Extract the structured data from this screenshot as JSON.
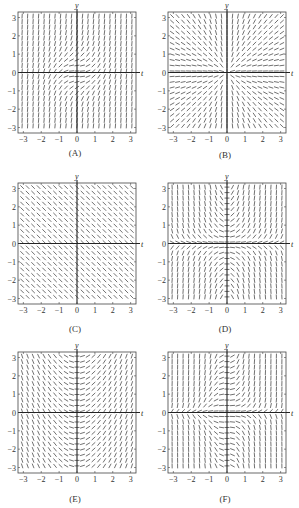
{
  "chart_data": [
    {
      "type": "slope-field",
      "label": "(A)",
      "formula_estimate": "dy/dt = t^2 + y^2",
      "xlabel": "t",
      "ylabel": "y",
      "xlim": [
        -3.3,
        3.3
      ],
      "ylim": [
        -3.3,
        3.3
      ],
      "xticks": [
        "-3",
        "-2",
        "-1",
        "0",
        "1",
        "2",
        "3"
      ],
      "yticks": [
        "-3",
        "-2",
        "-1",
        "0",
        "1",
        "2",
        "3"
      ],
      "grid_n": 21,
      "fn": "a"
    },
    {
      "type": "slope-field",
      "label": "(B)",
      "formula_estimate": "dy/dt = y/t",
      "xlabel": "t",
      "ylabel": "y",
      "xlim": [
        -3.3,
        3.3
      ],
      "ylim": [
        -3.3,
        3.3
      ],
      "xticks": [
        "-3",
        "-2",
        "-1",
        "0",
        "1",
        "2",
        "3"
      ],
      "yticks": [
        "-3",
        "-2",
        "-1",
        "0",
        "1",
        "2",
        "3"
      ],
      "grid_n": 21,
      "fn": "b"
    },
    {
      "type": "slope-field",
      "label": "(C)",
      "formula_estimate": "dy/dt = -1",
      "xlabel": "t",
      "ylabel": "y",
      "xlim": [
        -3.3,
        3.3
      ],
      "ylim": [
        -3.3,
        3.3
      ],
      "xticks": [
        "-3",
        "-2",
        "-1",
        "0",
        "1",
        "2",
        "3"
      ],
      "yticks": [
        "-3",
        "-2",
        "-1",
        "0",
        "1",
        "2",
        "3"
      ],
      "grid_n": 21,
      "fn": "c"
    },
    {
      "type": "slope-field",
      "label": "(D)",
      "formula_estimate": "dy/dt = t*y",
      "xlabel": "t",
      "ylabel": "y",
      "xlim": [
        -3.3,
        3.3
      ],
      "ylim": [
        -3.3,
        3.3
      ],
      "xticks": [
        "-3",
        "-2",
        "-1",
        "0",
        "1",
        "2",
        "3"
      ],
      "yticks": [
        "-3",
        "-2",
        "-1",
        "0",
        "1",
        "2",
        "3"
      ],
      "grid_n": 21,
      "fn": "d"
    },
    {
      "type": "slope-field",
      "label": "(E)",
      "formula_estimate": "dy/dt = t",
      "xlabel": "t",
      "ylabel": "y",
      "xlim": [
        -3.3,
        3.3
      ],
      "ylim": [
        -3.3,
        3.3
      ],
      "xticks": [
        "-3",
        "-2",
        "-1",
        "0",
        "1",
        "2",
        "3"
      ],
      "yticks": [
        "-3",
        "-2",
        "-1",
        "0",
        "1",
        "2",
        "3"
      ],
      "grid_n": 21,
      "fn": "e"
    },
    {
      "type": "slope-field",
      "label": "(F)",
      "formula_estimate": "dy/dt = t^2 * y",
      "xlabel": "t",
      "ylabel": "y",
      "xlim": [
        -3.3,
        3.3
      ],
      "ylim": [
        -3.3,
        3.3
      ],
      "xticks": [
        "-3",
        "-2",
        "-1",
        "0",
        "1",
        "2",
        "3"
      ],
      "yticks": [
        "-3",
        "-2",
        "-1",
        "0",
        "1",
        "2",
        "3"
      ],
      "grid_n": 21,
      "fn": "f"
    }
  ],
  "colors": {
    "axis": "#222222",
    "segment": "#333333",
    "frame": "#444444"
  }
}
